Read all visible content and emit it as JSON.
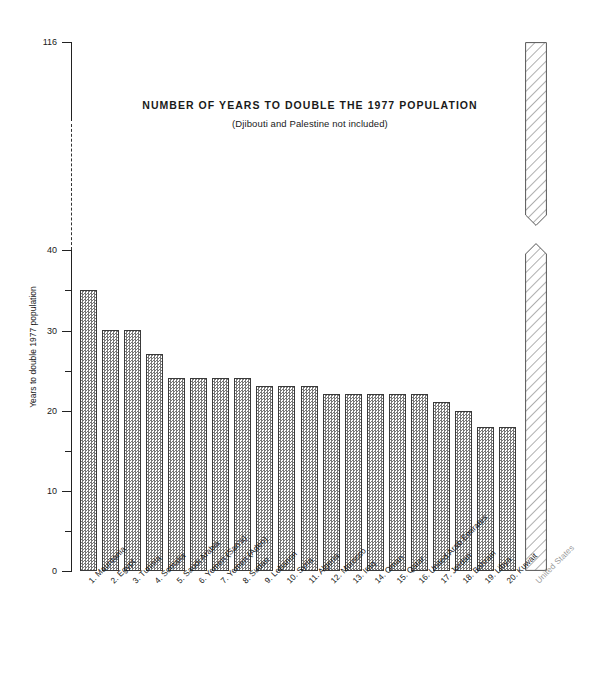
{
  "chart_data": {
    "type": "bar",
    "title": "NUMBER OF YEARS TO DOUBLE THE 1977 POPULATION",
    "subtitle": "(Djibouti and Palestine not included)",
    "xlabel": "",
    "ylabel": "Years to double 1977 population",
    "ylim": [
      0,
      116
    ],
    "y_axis_break": {
      "from": 40,
      "to": 116,
      "style": "dashed"
    },
    "grid": false,
    "legend": null,
    "y_ticks_major": [
      0,
      10,
      20,
      30,
      40,
      116
    ],
    "y_ticks_minor": [
      5,
      15,
      25,
      35
    ],
    "categories": [
      "1.  Mauritania",
      "2.  Egypt",
      "3.  Tunisia",
      "4.  Somalia",
      "5.  Saudi Arabia",
      "6.  Yemen (San'a)",
      "7.  Yemen (Aden)",
      "8.  Sudan",
      "9.  Lebanon",
      "10.  Syria",
      "11.  Algeria",
      "12.  Morocco",
      "13.  Iraq",
      "14.  Oman",
      "15.  Qatar",
      "16.  United Arab Emirates",
      "17.  Jordan",
      "18.  Bahrain",
      "19.  Libya",
      "20.  Kuwait",
      "United States"
    ],
    "values": [
      35,
      30,
      30,
      27,
      24,
      24,
      24,
      24,
      23,
      23,
      23,
      22,
      22,
      22,
      22,
      22,
      21,
      20,
      18,
      18,
      116
    ]
  },
  "axis_labels": {
    "t0": "0",
    "t10": "10",
    "t20": "20",
    "t30": "30",
    "t40": "40",
    "t116": "116"
  },
  "colors": {
    "axis": "#222222",
    "bar_outline": "#3a3a3a",
    "bar_fill_pattern": "#777777",
    "us_label": "#9a9a9a",
    "background": "#ffffff"
  }
}
